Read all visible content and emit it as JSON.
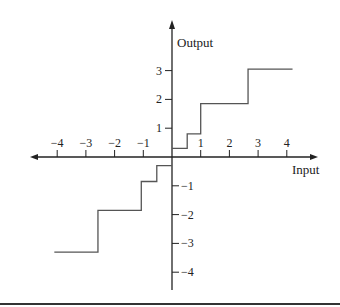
{
  "chart_data": {
    "type": "line",
    "subtype": "step",
    "title": "",
    "xlabel": "Input",
    "ylabel": "Output",
    "xlim": [
      -4.5,
      5.1
    ],
    "ylim": [
      -4.6,
      4.8
    ],
    "grid": false,
    "legend": null,
    "x_ticks": [
      -4,
      -3,
      -2,
      -1,
      1,
      2,
      3,
      4
    ],
    "x_tick_labels": [
      "−4",
      "−3",
      "−2",
      "−1",
      "1",
      "2",
      "3",
      "4"
    ],
    "y_ticks": [
      3,
      2,
      1,
      -1,
      -2,
      -3,
      -4
    ],
    "y_tick_labels": [
      "3",
      "2",
      "1",
      "−1",
      "−2",
      "−3",
      "−4"
    ],
    "series": [
      {
        "name": "positive branch",
        "segments": [
          {
            "x_start": 0,
            "x_end": 0.53,
            "y": 0.3
          },
          {
            "x_start": 0.53,
            "x_end": 1.0,
            "y": 0.8
          },
          {
            "x_start": 1.0,
            "x_end": 2.65,
            "y": 1.85
          },
          {
            "x_start": 2.65,
            "x_end": 4.2,
            "y": 3.05
          }
        ]
      },
      {
        "name": "negative branch",
        "segments": [
          {
            "x_start": 0,
            "x_end": -0.53,
            "y": -0.3
          },
          {
            "x_start": -0.53,
            "x_end": -1.07,
            "y": -0.85
          },
          {
            "x_start": -1.07,
            "x_end": -2.58,
            "y": -1.85
          },
          {
            "x_start": -2.58,
            "x_end": -4.1,
            "y": -3.3
          }
        ]
      }
    ],
    "colors": {
      "axis": "#222222",
      "step_line": "#555555"
    }
  }
}
